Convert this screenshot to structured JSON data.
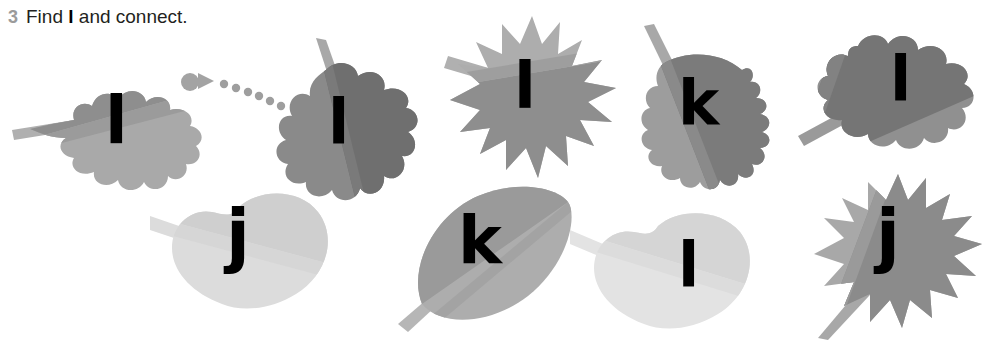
{
  "header": {
    "task_number": "3",
    "instruction_prefix": "Find",
    "target_letter": "l",
    "instruction_suffix": "and connect."
  },
  "palette": {
    "leaf_dark": "#7d7d7d",
    "leaf_mid_dark": "#8e8e8e",
    "leaf_mid": "#9a9a9a",
    "leaf_light": "#b0b0b0",
    "leaf_pale": "#c6c6c6",
    "leaf_palest": "#d9d9d9",
    "leaf_faint": "#e2e2e2",
    "stem": "#b4b4b4",
    "letter": "#000000",
    "number": "#9b9b9b",
    "text": "#231f20",
    "connector": "#9a9a9a",
    "background": "#ffffff"
  },
  "connector": {
    "name": "dotted-arrow",
    "start_x": 190,
    "start_y": 82,
    "dot_count": 7,
    "head_x": 205,
    "head_y": 80,
    "end_x": 272,
    "end_y": 108
  },
  "leaves": [
    {
      "id": "leaf-1",
      "letter": "l",
      "shape": "serrated-oval",
      "row": "top",
      "position": 1,
      "selected": true,
      "x": 12,
      "y": 52,
      "w": 190,
      "h": 140,
      "letter_x": 105,
      "letter_y": 92,
      "letter_size": 62,
      "fill_dark": "#8e8e8e",
      "fill_light": "#a7a7a7",
      "stem": "left-horizontal"
    },
    {
      "id": "leaf-2",
      "letter": "l",
      "shape": "oak-lobed",
      "row": "top",
      "position": 2,
      "selected": false,
      "x": 264,
      "y": 38,
      "w": 155,
      "h": 175,
      "letter_x": 335,
      "letter_y": 108,
      "letter_size": 58,
      "fill_dark": "#6f6f6f",
      "fill_light": "#8a8a8a",
      "stem": "up-left"
    },
    {
      "id": "leaf-3",
      "letter": "l",
      "shape": "maple-spiky",
      "row": "top",
      "position": 3,
      "selected": false,
      "x": 442,
      "y": 10,
      "w": 170,
      "h": 170,
      "letter_x": 523,
      "letter_y": 62,
      "letter_size": 60,
      "fill_dark": "#8e8e8e",
      "fill_light": "#adadad",
      "stem": "left-up"
    },
    {
      "id": "leaf-4",
      "letter": "k",
      "shape": "wavy-teardrop",
      "row": "top",
      "position": 4,
      "selected": false,
      "x": 618,
      "y": 22,
      "w": 170,
      "h": 172,
      "letter_x": 690,
      "letter_y": 88,
      "letter_size": 58,
      "fill_dark": "#7b7b7b",
      "fill_light": "#9d9d9d",
      "stem": "up-left"
    },
    {
      "id": "leaf-5",
      "letter": "l",
      "shape": "oak-lobed-wide",
      "row": "top",
      "position": 5,
      "selected": false,
      "x": 798,
      "y": 18,
      "w": 180,
      "h": 150,
      "letter_x": 896,
      "letter_y": 62,
      "letter_size": 58,
      "fill_dark": "#757575",
      "fill_light": "#909090",
      "stem": "down-left"
    },
    {
      "id": "leaf-6",
      "letter": "j",
      "shape": "heart",
      "row": "bottom",
      "position": 1,
      "selected": false,
      "x": 150,
      "y": 186,
      "w": 185,
      "h": 135,
      "letter_x": 237,
      "letter_y": 212,
      "letter_size": 66,
      "fill_dark": "#cfcfcf",
      "fill_light": "#dcdcdc",
      "stem": "upper-left"
    },
    {
      "id": "leaf-7",
      "letter": "k",
      "shape": "smooth-pointed",
      "row": "bottom",
      "position": 2,
      "selected": false,
      "x": 398,
      "y": 182,
      "w": 175,
      "h": 145,
      "letter_x": 475,
      "letter_y": 216,
      "letter_size": 62,
      "fill_dark": "#9a9a9a",
      "fill_light": "#adadad",
      "stem": "lower-left"
    },
    {
      "id": "leaf-8",
      "letter": "l",
      "shape": "heart",
      "row": "bottom",
      "position": 3,
      "selected": false,
      "x": 570,
      "y": 212,
      "w": 185,
      "h": 123,
      "letter_x": 687,
      "letter_y": 244,
      "letter_size": 58,
      "fill_dark": "#d5d5d5",
      "fill_light": "#e3e3e3",
      "stem": "left"
    },
    {
      "id": "leaf-9",
      "letter": "j",
      "shape": "maple-spiky",
      "row": "bottom",
      "position": 4,
      "selected": false,
      "x": 810,
      "y": 170,
      "w": 165,
      "h": 165,
      "letter_x": 890,
      "letter_y": 208,
      "letter_size": 64,
      "fill_dark": "#8b8b8b",
      "fill_light": "#a8a8a8",
      "stem": "down-left"
    }
  ]
}
